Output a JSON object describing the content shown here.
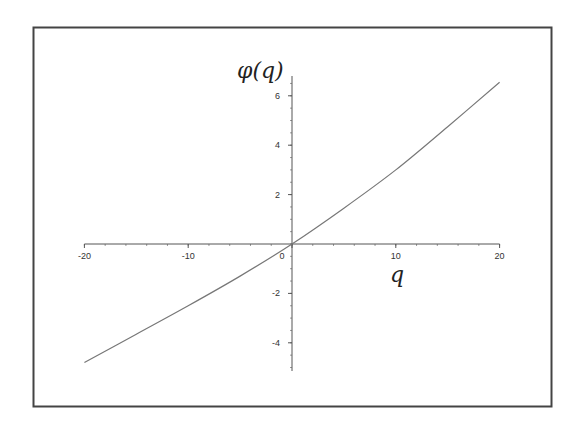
{
  "chart_data": {
    "type": "line",
    "title": "",
    "xlabel": "q",
    "ylabel": "φ(q)",
    "xlim": [
      -20,
      20
    ],
    "ylim": [
      -5,
      7
    ],
    "grid": false,
    "legend": null,
    "x_ticks": [
      -20,
      -10,
      0,
      10,
      20
    ],
    "x_tick_labels": [
      "-20",
      "-10",
      "0",
      "10",
      "20"
    ],
    "y_ticks": [
      -4,
      -2,
      2,
      4,
      6
    ],
    "y_tick_labels": [
      "-4",
      "-2",
      "2",
      "4",
      "6"
    ],
    "series": [
      {
        "name": "φ(q)",
        "color": "#777777",
        "x": [
          -20,
          -15,
          -10,
          -5,
          0,
          5,
          10,
          15,
          20
        ],
        "y": [
          -4.8,
          -3.65,
          -2.5,
          -1.3,
          0.0,
          1.45,
          3.0,
          4.75,
          6.55
        ]
      }
    ]
  },
  "frame": {
    "border_color": "#444444"
  },
  "axes": {
    "color": "#555555"
  }
}
